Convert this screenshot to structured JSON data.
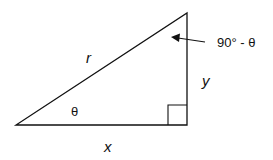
{
  "diagram": {
    "type": "right-triangle",
    "labels": {
      "hypotenuse": "r",
      "vertical_side": "y",
      "horizontal_side": "x",
      "angle_bottom_left": "θ",
      "angle_top": "90° - θ"
    },
    "colors": {
      "stroke": "#111111",
      "background": "#ffffff"
    }
  }
}
